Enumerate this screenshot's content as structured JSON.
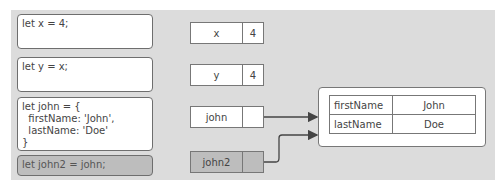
{
  "code_blocks": [
    {
      "text": "let x = 4;",
      "highlighted": false
    },
    {
      "text": "let y = x;",
      "highlighted": false
    },
    {
      "text": "let john = {\n  firstName: 'John',\n  lastName: 'Doe'\n}",
      "highlighted": false
    },
    {
      "text": "let john2 = john;",
      "highlighted": true
    }
  ],
  "variables": [
    {
      "name": "x",
      "value": "4",
      "highlighted": false
    },
    {
      "name": "y",
      "value": "4",
      "highlighted": false
    },
    {
      "name": "john",
      "value": "",
      "highlighted": false,
      "reference": true
    },
    {
      "name": "john2",
      "value": "",
      "highlighted": true,
      "reference": true
    }
  ],
  "heap_object": {
    "properties": [
      {
        "key": "firstName",
        "value": "John"
      },
      {
        "key": "lastName",
        "value": "Doe"
      }
    ]
  },
  "colors": {
    "background": "#dcdcdc",
    "highlight": "#bdbdbd",
    "box": "#ffffff",
    "border": "#6e6e6e"
  }
}
